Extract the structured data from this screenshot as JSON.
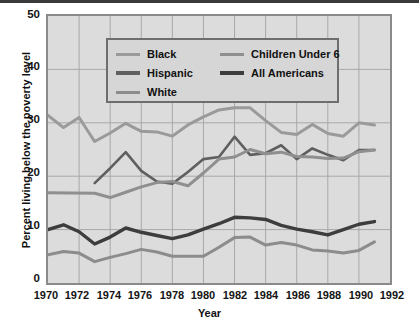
{
  "chart_data": {
    "type": "line",
    "title": "",
    "xlabel": "Year",
    "ylabel": "Percent living below the poverty level",
    "xlim": [
      1970,
      1992
    ],
    "ylim": [
      0,
      50
    ],
    "grid": true,
    "legend_position": "upper-left-inside",
    "x_ticks": [
      "1970",
      "1972",
      "1974",
      "1976",
      "1978",
      "1980",
      "1982",
      "1984",
      "1986",
      "1988",
      "1990",
      "1992"
    ],
    "y_ticks": [
      "0",
      "10",
      "20",
      "30",
      "40",
      "50"
    ],
    "series": [
      {
        "name": "Black",
        "color": "#9a9a9a",
        "width": 3.0,
        "x": [
          1970,
          1971,
          1972,
          1973,
          1974,
          1975,
          1976,
          1977,
          1978,
          1979,
          1980,
          1981,
          1982,
          1983,
          1984,
          1985,
          1986,
          1987,
          1988,
          1989,
          1990,
          1991
        ],
        "values": [
          31.4,
          29.1,
          31.0,
          26.5,
          28.1,
          29.9,
          28.4,
          28.3,
          27.5,
          29.6,
          31.1,
          32.4,
          32.8,
          32.8,
          30.4,
          28.2,
          27.8,
          29.7,
          28.0,
          27.5,
          30.0,
          29.6
        ]
      },
      {
        "name": "Hispanic",
        "color": "#5f5f5f",
        "width": 2.6,
        "x": [
          1973,
          1974,
          1975,
          1976,
          1977,
          1978,
          1979,
          1980,
          1981,
          1982,
          1983,
          1984,
          1985,
          1986,
          1987,
          1988,
          1989,
          1990,
          1991
        ],
        "values": [
          18.7,
          21.5,
          24.5,
          21.0,
          19.0,
          18.6,
          20.8,
          23.2,
          23.6,
          27.4,
          24.0,
          24.3,
          25.8,
          23.2,
          25.2,
          24.0,
          23.0,
          24.9,
          24.9
        ]
      },
      {
        "name": "White",
        "color": "#8c8c8c",
        "width": 3.0,
        "x": [
          1970,
          1971,
          1972,
          1973,
          1974,
          1975,
          1976,
          1977,
          1978,
          1979,
          1980,
          1981,
          1982,
          1983,
          1984,
          1985,
          1986,
          1987,
          1988,
          1989,
          1990,
          1991
        ],
        "values": [
          5.3,
          5.9,
          5.6,
          4.0,
          4.8,
          5.5,
          6.3,
          5.8,
          5.0,
          5.0,
          5.0,
          6.7,
          8.5,
          8.6,
          7.1,
          7.6,
          7.1,
          6.2,
          6.0,
          5.6,
          6.1,
          7.7
        ]
      },
      {
        "name": "Children Under 6",
        "color": "#8f8f8f",
        "width": 3.0,
        "x": [
          1970,
          1973,
          1974,
          1975,
          1976,
          1977,
          1978,
          1979,
          1980,
          1981,
          1982,
          1983,
          1984,
          1985,
          1986,
          1987,
          1988,
          1989,
          1990,
          1991
        ],
        "values": [
          16.9,
          16.8,
          16.0,
          17.0,
          18.0,
          18.8,
          19.0,
          18.2,
          20.6,
          23.2,
          23.6,
          25.0,
          24.2,
          24.5,
          23.7,
          23.6,
          23.3,
          23.4,
          24.6,
          24.9
        ]
      },
      {
        "name": "All Americans",
        "color": "#3d3d3d",
        "width": 3.4,
        "x": [
          1970,
          1971,
          1972,
          1973,
          1974,
          1975,
          1976,
          1977,
          1978,
          1979,
          1980,
          1981,
          1982,
          1983,
          1984,
          1985,
          1986,
          1987,
          1988,
          1989,
          1990,
          1991
        ],
        "values": [
          10.0,
          10.9,
          9.6,
          7.3,
          8.6,
          10.3,
          9.5,
          8.9,
          8.3,
          9.0,
          10.1,
          11.1,
          12.3,
          12.2,
          11.9,
          10.8,
          10.1,
          9.6,
          9.0,
          10.0,
          11.0,
          11.5
        ]
      }
    ]
  },
  "legend": {
    "left_column": [
      {
        "label": "Black",
        "color": "#9a9a9a",
        "width": 3
      },
      {
        "label": "Hispanic",
        "color": "#5f5f5f",
        "width": 4
      },
      {
        "label": "White",
        "color": "#8c8c8c",
        "width": 3
      }
    ],
    "right_column": [
      {
        "label": "Children Under 6",
        "color": "#8f8f8f",
        "width": 3
      },
      {
        "label": "All Americans",
        "color": "#3d3d3d",
        "width": 4
      }
    ]
  },
  "axes": {
    "y_title": "Percent living below the poverty level",
    "x_title": "Year"
  },
  "colors": {
    "plot_background": "#dcdcdc",
    "grid": "#a8a8a8",
    "frame": "#8a8a8a",
    "page_background": "#ffffff",
    "text": "#111111"
  }
}
